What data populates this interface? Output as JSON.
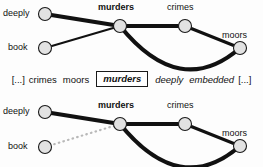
{
  "figure": {
    "type": "dependency-graph-pair",
    "background_color": "#fdfdfd",
    "node_fill": "#e2e2e2",
    "node_stroke": "#1a1a1a",
    "edge_color": "#111111",
    "inactive_edge_color": "#b8b8b8"
  },
  "top_graph": {
    "name": "top-graph",
    "nodes": [
      {
        "id": "deeply",
        "label": "deeply",
        "bold": false,
        "cx": 45,
        "cy": 14,
        "r": 6.5,
        "label_x": 3,
        "label_y": 8
      },
      {
        "id": "book",
        "label": "book",
        "bold": false,
        "cx": 45,
        "cy": 48,
        "r": 6.5,
        "label_x": 8,
        "label_y": 42
      },
      {
        "id": "murders",
        "label": "murders",
        "bold": true,
        "cx": 120,
        "cy": 26,
        "r": 6.5,
        "label_x": 98,
        "label_y": 2
      },
      {
        "id": "crimes",
        "label": "crimes",
        "bold": false,
        "cx": 185,
        "cy": 26,
        "r": 6.5,
        "label_x": 167,
        "label_y": 2
      },
      {
        "id": "moors",
        "label": "moors",
        "bold": false,
        "cx": 240,
        "cy": 48,
        "r": 6.5,
        "label_x": 222,
        "label_y": 30
      }
    ],
    "edges": [
      {
        "from": "deeply",
        "to": "murders",
        "style": "solid",
        "curve": "straight",
        "width": 4.2
      },
      {
        "from": "book",
        "to": "murders",
        "style": "solid",
        "curve": "straight",
        "width": 2.0
      },
      {
        "from": "murders",
        "to": "crimes",
        "style": "solid",
        "curve": "straight",
        "width": 4.2
      },
      {
        "from": "crimes",
        "to": "moors",
        "style": "solid",
        "curve": "straight",
        "width": 3.2
      },
      {
        "from": "murders",
        "to": "moors",
        "style": "solid",
        "curve": "arc-below",
        "width": 4.2
      }
    ]
  },
  "sentence": {
    "name": "sentence-line",
    "tokens": [
      {
        "text": "[...]",
        "style": "plain",
        "boxed": false
      },
      {
        "text": "crimes",
        "style": "plain",
        "boxed": false
      },
      {
        "text": "moors",
        "style": "plain",
        "boxed": false
      },
      {
        "text": "murders",
        "style": "bold-italic",
        "boxed": true
      },
      {
        "text": "deeply",
        "style": "italic",
        "boxed": false
      },
      {
        "text": "embedded",
        "style": "italic",
        "boxed": false
      },
      {
        "text": "[...]",
        "style": "plain",
        "boxed": false
      }
    ]
  },
  "bottom_graph": {
    "name": "bottom-graph",
    "nodes": [
      {
        "id": "deeply",
        "label": "deeply",
        "bold": false,
        "cx": 45,
        "cy": 112,
        "r": 6.5,
        "label_x": 3,
        "label_y": 106
      },
      {
        "id": "book",
        "label": "book",
        "bold": false,
        "cx": 45,
        "cy": 147,
        "r": 6.5,
        "label_x": 8,
        "label_y": 141
      },
      {
        "id": "murders",
        "label": "murders",
        "bold": true,
        "cx": 120,
        "cy": 124,
        "r": 6.5,
        "label_x": 98,
        "label_y": 100
      },
      {
        "id": "crimes",
        "label": "crimes",
        "bold": false,
        "cx": 185,
        "cy": 124,
        "r": 6.5,
        "label_x": 167,
        "label_y": 100
      },
      {
        "id": "moors",
        "label": "moors",
        "bold": false,
        "cx": 240,
        "cy": 146,
        "r": 6.5,
        "label_x": 222,
        "label_y": 128
      }
    ],
    "edges": [
      {
        "from": "deeply",
        "to": "murders",
        "style": "solid",
        "curve": "straight",
        "width": 4.2
      },
      {
        "from": "book",
        "to": "murders",
        "style": "dotted",
        "curve": "straight",
        "width": 2.2
      },
      {
        "from": "murders",
        "to": "crimes",
        "style": "solid",
        "curve": "straight",
        "width": 4.2
      },
      {
        "from": "crimes",
        "to": "moors",
        "style": "solid",
        "curve": "straight",
        "width": 3.2
      },
      {
        "from": "murders",
        "to": "moors",
        "style": "solid",
        "curve": "arc-below",
        "width": 4.2
      }
    ]
  }
}
